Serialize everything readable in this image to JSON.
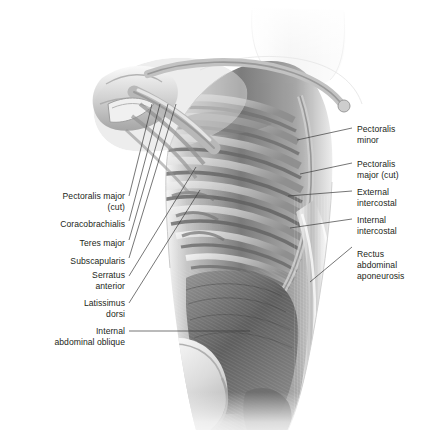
{
  "figure": {
    "background_color": "#ffffff",
    "label_color": "#231f20",
    "leader_line_color": "#3b3b3b"
  },
  "labels_left": [
    {
      "text": "Pectoralis major\n(cut)",
      "x": 30,
      "y": 191,
      "width": 95
    },
    {
      "text": "Coracobrachialis",
      "x": 30,
      "y": 219,
      "width": 95
    },
    {
      "text": "Teres major",
      "x": 30,
      "y": 238,
      "width": 95
    },
    {
      "text": "Subscapularis",
      "x": 30,
      "y": 256,
      "width": 95
    },
    {
      "text": "Serratus\nanterior",
      "x": 30,
      "y": 270,
      "width": 95
    },
    {
      "text": "Latissimus\ndorsi",
      "x": 30,
      "y": 298,
      "width": 95
    },
    {
      "text": "Internal\nabdominal oblique",
      "x": 12,
      "y": 326,
      "width": 113
    }
  ],
  "labels_right": [
    {
      "text": "Pectoralis\nminor",
      "x": 357,
      "y": 124,
      "width": 70
    },
    {
      "text": "Pectoralis\nmajor (cut)",
      "x": 357,
      "y": 159,
      "width": 70
    },
    {
      "text": "External\nintercostal",
      "x": 357,
      "y": 187,
      "width": 70
    },
    {
      "text": "Internal\nintercostal",
      "x": 357,
      "y": 215,
      "width": 70
    },
    {
      "text": "Rectus\nabdominal\naponeurosis",
      "x": 357,
      "y": 249,
      "width": 70
    }
  ],
  "leader_lines": [
    {
      "name": "pectoralis-major-cut",
      "x1": 129,
      "y1": 196,
      "x2": 152,
      "y2": 104
    },
    {
      "name": "coracobrachialis",
      "x1": 129,
      "y1": 221,
      "x2": 160,
      "y2": 104
    },
    {
      "name": "teres-major",
      "x1": 129,
      "y1": 240,
      "x2": 168,
      "y2": 104
    },
    {
      "name": "subscapularis",
      "x1": 129,
      "y1": 258,
      "x2": 176,
      "y2": 104
    },
    {
      "name": "serratus-anterior",
      "x1": 129,
      "y1": 276,
      "x2": 196,
      "y2": 167
    },
    {
      "name": "latissimus-dorsi",
      "x1": 129,
      "y1": 303,
      "x2": 200,
      "y2": 190
    },
    {
      "name": "internal-abdominal-oblique",
      "x1": 129,
      "y1": 331,
      "x2": 250,
      "y2": 331
    },
    {
      "name": "pectoralis-minor",
      "x1": 352,
      "y1": 128,
      "x2": 297,
      "y2": 140
    },
    {
      "name": "pectoralis-major-cut-right",
      "x1": 352,
      "y1": 163,
      "x2": 300,
      "y2": 174
    },
    {
      "name": "external-intercostal",
      "x1": 352,
      "y1": 191,
      "x2": 288,
      "y2": 196
    },
    {
      "name": "internal-intercostal",
      "x1": 352,
      "y1": 219,
      "x2": 290,
      "y2": 228
    },
    {
      "name": "rectus-abdominal-aponeurosis",
      "x1": 352,
      "y1": 247,
      "x2": 310,
      "y2": 282
    }
  ],
  "anatomy": {
    "regions": [
      {
        "name": "neck",
        "tone": "#f2f2f2"
      },
      {
        "name": "clavicle",
        "tone": "#b9b9b9"
      },
      {
        "name": "scapula",
        "tone": "#a8a8a8"
      },
      {
        "name": "humerus",
        "tone": "#9a9a9a"
      },
      {
        "name": "ribcage",
        "tone": "#8d8d8d"
      },
      {
        "name": "intercostal-muscle",
        "tone": "#6e6e6e"
      },
      {
        "name": "abdominal-oblique",
        "tone": "#6a6a6a"
      },
      {
        "name": "rectus-sheath",
        "tone": "#c8c8c8"
      },
      {
        "name": "iliac-crest",
        "tone": "#dcdcdc"
      }
    ]
  }
}
